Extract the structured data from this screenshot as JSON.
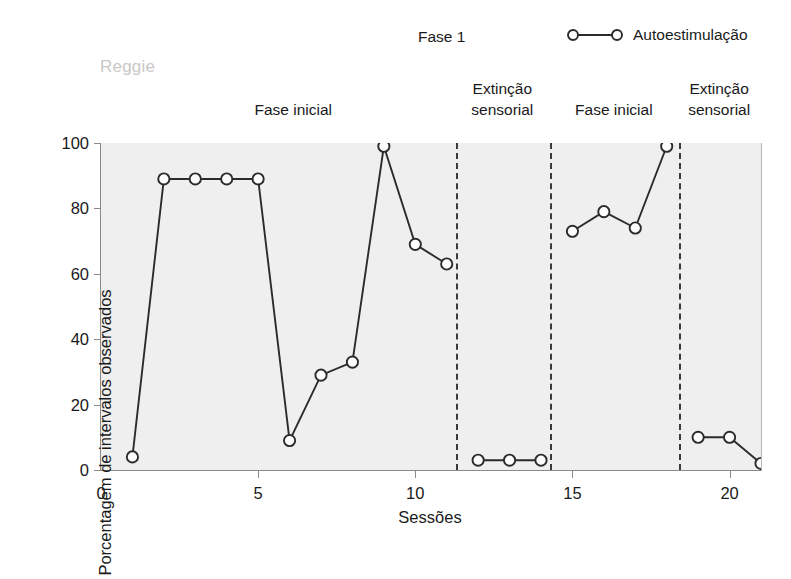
{
  "subject": "Reggie",
  "phase_top_label": "Fase 1",
  "legend": {
    "entries": [
      {
        "label": "Autoestimulação",
        "marker": "open-circle-line",
        "color": "#2b2b2b"
      }
    ]
  },
  "phase_bands": [
    {
      "id": "fase-inicial-1",
      "lines": [
        "Fase inicial",
        ""
      ],
      "x_start": 1,
      "x_end": 11.3
    },
    {
      "id": "extincao-sensorial-1",
      "lines": [
        "Extinção",
        "sensorial"
      ],
      "x_start": 11.3,
      "x_end": 14.3
    },
    {
      "id": "fase-inicial-2",
      "lines": [
        "Fase inicial",
        ""
      ],
      "x_start": 14.3,
      "x_end": 18.4
    },
    {
      "id": "extincao-sensorial-2",
      "lines": [
        "Extinção",
        "sensorial"
      ],
      "x_start": 18.4,
      "x_end": 21.0
    }
  ],
  "dividers": [
    11.3,
    14.3,
    18.4
  ],
  "chart_data": {
    "type": "line",
    "title": "",
    "subtitle": "",
    "xlabel": "Sessões",
    "ylabel": "Porcentagem de intervalos observados",
    "xlim": [
      0,
      21
    ],
    "ylim": [
      0,
      100
    ],
    "xticks": [
      0,
      5,
      10,
      15,
      20
    ],
    "yticks": [
      0,
      20,
      40,
      60,
      80,
      100
    ],
    "grid": false,
    "legend_position": "top-right",
    "marker": "open-circle",
    "series": [
      {
        "name": "Autoestimulação",
        "color": "#2b2b2b",
        "segments": [
          {
            "phase": "Fase inicial",
            "x": [
              1,
              2,
              3,
              4,
              5,
              6,
              7,
              8,
              9,
              10,
              11
            ],
            "y": [
              4,
              89,
              89,
              89,
              89,
              9,
              29,
              33,
              99,
              69,
              63
            ]
          },
          {
            "phase": "Extinção sensorial",
            "x": [
              12,
              13,
              14
            ],
            "y": [
              3,
              3,
              3
            ]
          },
          {
            "phase": "Fase inicial",
            "x": [
              15,
              16,
              17,
              18
            ],
            "y": [
              73,
              79,
              74,
              99
            ]
          },
          {
            "phase": "Extinção sensorial",
            "x": [
              19,
              20,
              21
            ],
            "y": [
              10,
              10,
              2
            ]
          }
        ]
      }
    ]
  },
  "colors": {
    "plot_background": "#efefef",
    "axis": "#8a8a8a",
    "line": "#2b2b2b",
    "marker_fill": "#fdfdfd",
    "divider": "#3a3a3a",
    "subject_text": "#c8c8c8"
  }
}
